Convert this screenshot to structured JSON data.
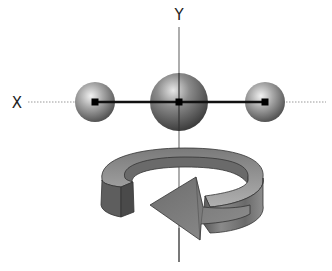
{
  "diagram": {
    "type": "molecule-rotation-schematic",
    "axes": {
      "x": {
        "label": "X",
        "style": "dotted"
      },
      "y": {
        "label": "Y",
        "style": "solid"
      }
    },
    "atoms": [
      {
        "name": "left-atom",
        "size": "small",
        "cx": 95,
        "cy": 102,
        "r": 20
      },
      {
        "name": "center-atom",
        "size": "large",
        "cx": 179,
        "cy": 102,
        "r": 29
      },
      {
        "name": "right-atom",
        "size": "small",
        "cx": 265,
        "cy": 102,
        "r": 20
      }
    ],
    "bond": {
      "from": "left-atom",
      "to": "right-atom",
      "style": "solid-black"
    },
    "rotation_arrow": {
      "axis": "y",
      "direction": "counter-clockwise (viewed from top)"
    },
    "colors": {
      "axis": "#777777",
      "bond": "#111111",
      "atom_light": "#e8e8e8",
      "atom_dark": "#555555",
      "ring_top": "#9a9a9a",
      "ring_side": "#6e6e6e",
      "arrow_fill": "#808080",
      "outline": "#333333"
    }
  }
}
